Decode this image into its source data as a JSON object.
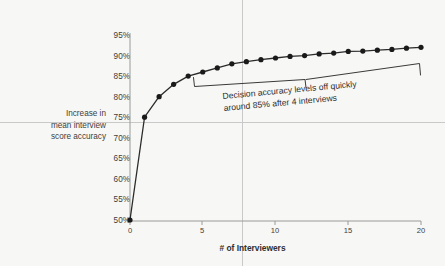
{
  "chart_data": {
    "type": "line",
    "title": "",
    "subtitle": "",
    "xlabel": "# of Interviewers",
    "ylabel": "Increase in mean interview score accuracy",
    "ylabel_lines": [
      "Increase in",
      "mean interview",
      "score accuracy"
    ],
    "x": [
      0,
      1,
      2,
      3,
      4,
      5,
      6,
      7,
      8,
      9,
      10,
      11,
      12,
      13,
      14,
      15,
      16,
      17,
      18,
      19,
      20
    ],
    "values": [
      50,
      75,
      80,
      83,
      85,
      86,
      87,
      88,
      88.5,
      89,
      89.4,
      89.8,
      90,
      90.4,
      90.6,
      91,
      91.1,
      91.3,
      91.5,
      91.8,
      92
    ],
    "series": [
      {
        "name": "Increase in mean interview score accuracy",
        "values": [
          50,
          75,
          80,
          83,
          85,
          86,
          87,
          88,
          88.5,
          89,
          89.4,
          89.8,
          90,
          90.4,
          90.6,
          91,
          91.1,
          91.3,
          91.5,
          91.8,
          92
        ]
      }
    ],
    "xlim": [
      0,
      20
    ],
    "ylim": [
      50,
      95
    ],
    "xticks": [
      0,
      5,
      10,
      15,
      20
    ],
    "xtick_labels": [
      "0",
      "5",
      "10",
      "15",
      "20"
    ],
    "yticks": [
      50,
      55,
      60,
      65,
      70,
      75,
      80,
      85,
      90,
      95
    ],
    "ytick_labels": [
      "50%",
      "55%",
      "60%",
      "65%",
      "70%",
      "75%",
      "80%",
      "85%",
      "90%",
      "95%"
    ],
    "grid": false,
    "legend": "none",
    "marker": "filled-circle",
    "line_color": "#2b2b2b",
    "marker_color": "#1a1a1a",
    "background_color": "#f7f7f5",
    "annotations": [
      {
        "text_lines": [
          "Decision accuracy levels off quickly",
          "around 85% after 4 interviews"
        ],
        "text": "Decision accuracy levels off quickly around 85% after 4 interviews",
        "bracket_x_start": 5,
        "bracket_x_end": 20,
        "rotation_deg": -5.2
      }
    ]
  },
  "axis": {
    "y_caption_line1": "Increase in",
    "y_caption_line2": "mean interview",
    "y_caption_line3": "score accuracy",
    "x_title": "# of Interviewers"
  },
  "annotation": {
    "line1": "Decision accuracy levels off quickly",
    "line2": "around 85% after 4 interviews"
  }
}
